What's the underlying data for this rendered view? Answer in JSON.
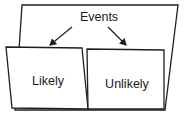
{
  "diagram": {
    "root": {
      "label": "Events"
    },
    "children": [
      {
        "label": "Likely"
      },
      {
        "label": "Unlikely"
      }
    ],
    "colors": {
      "stroke": "#1f1f1f",
      "fill": "#ffffff",
      "text": "#1a1a1a"
    }
  }
}
